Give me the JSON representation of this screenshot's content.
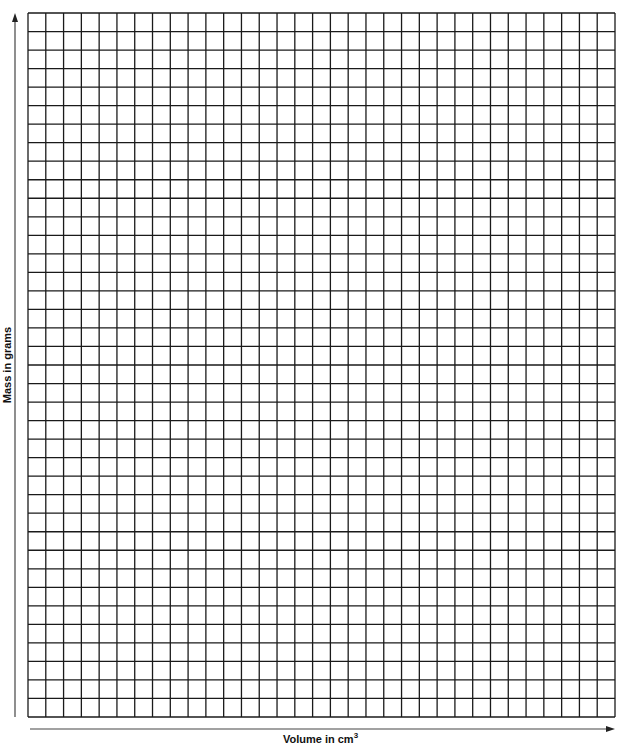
{
  "chart_data": {
    "type": "scatter",
    "title": "",
    "xlabel": "Volume in cm",
    "xlabel_superscript": "3",
    "ylabel": "Mass in grams",
    "series": [],
    "grid": {
      "on": true,
      "columns": 33,
      "rows": 38,
      "line_color": "#1a1a1a"
    },
    "axes": {
      "x_arrow": true,
      "y_arrow": true,
      "tick_labels": "none",
      "color": "#333333"
    },
    "layout": {
      "grid_left": 28,
      "grid_top": 13,
      "grid_right": 615,
      "grid_bottom": 717,
      "y_axis_x": 15,
      "x_axis_y": 729
    },
    "note": "Blank graph paper; no data plotted"
  }
}
